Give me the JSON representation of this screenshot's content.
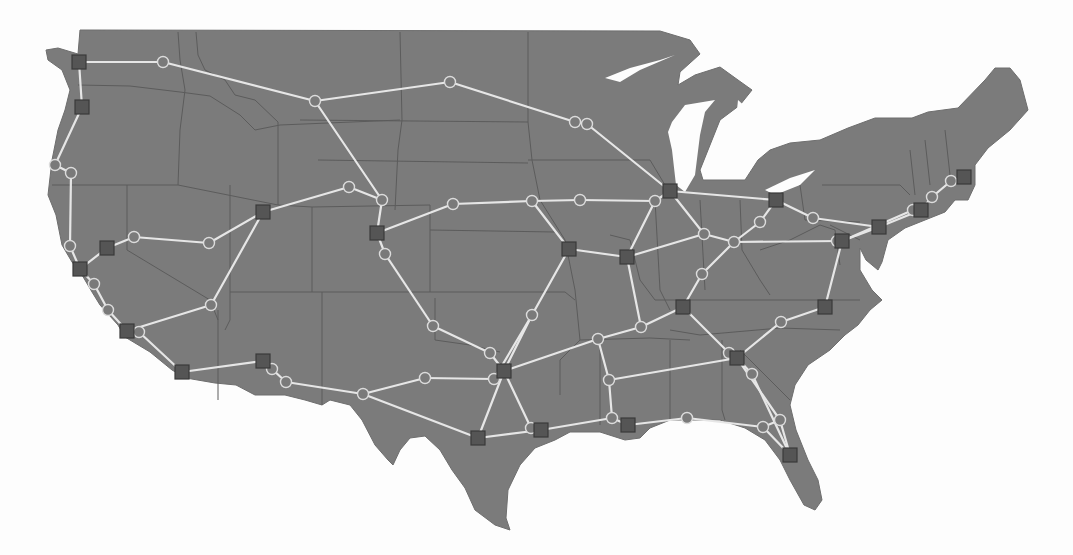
{
  "map": {
    "region": "Contiguous United States",
    "colors": {
      "background": "#fdfdfd",
      "land": "#7b7b7b",
      "state_border": "#5c5c5c",
      "link": "#e6e6e6",
      "hub_fill": "#555555",
      "relay_fill": "#7a7a7a",
      "relay_stroke": "#dcdcdc"
    },
    "legend_icons": {
      "hub": "square-node-icon",
      "relay": "circle-node-icon"
    },
    "hubs": [
      {
        "id": "h1",
        "x": 79,
        "y": 62
      },
      {
        "id": "h2",
        "x": 82,
        "y": 107
      },
      {
        "id": "h3",
        "x": 107,
        "y": 248
      },
      {
        "id": "h4",
        "x": 80,
        "y": 269
      },
      {
        "id": "h5",
        "x": 127,
        "y": 331
      },
      {
        "id": "h6",
        "x": 182,
        "y": 372
      },
      {
        "id": "h7",
        "x": 263,
        "y": 361
      },
      {
        "id": "h8",
        "x": 263,
        "y": 212
      },
      {
        "id": "h9",
        "x": 377,
        "y": 233
      },
      {
        "id": "h10",
        "x": 569,
        "y": 249
      },
      {
        "id": "h11",
        "x": 627,
        "y": 257
      },
      {
        "id": "h12",
        "x": 670,
        "y": 191
      },
      {
        "id": "h13",
        "x": 776,
        "y": 200
      },
      {
        "id": "h14",
        "x": 683,
        "y": 307
      },
      {
        "id": "h15",
        "x": 737,
        "y": 358
      },
      {
        "id": "h16",
        "x": 825,
        "y": 307
      },
      {
        "id": "h17",
        "x": 842,
        "y": 241
      },
      {
        "id": "h18",
        "x": 879,
        "y": 227
      },
      {
        "id": "h19",
        "x": 921,
        "y": 210
      },
      {
        "id": "h20",
        "x": 964,
        "y": 177
      },
      {
        "id": "h21",
        "x": 504,
        "y": 371
      },
      {
        "id": "h22",
        "x": 478,
        "y": 438
      },
      {
        "id": "h23",
        "x": 541,
        "y": 430
      },
      {
        "id": "h24",
        "x": 628,
        "y": 425
      },
      {
        "id": "h25",
        "x": 790,
        "y": 455
      }
    ],
    "relays": [
      {
        "id": "r1",
        "x": 163,
        "y": 62
      },
      {
        "id": "r2",
        "x": 315,
        "y": 101
      },
      {
        "id": "r3",
        "x": 450,
        "y": 82
      },
      {
        "id": "r4",
        "x": 575,
        "y": 122
      },
      {
        "id": "r5",
        "x": 587,
        "y": 124
      },
      {
        "id": "r6",
        "x": 55,
        "y": 165
      },
      {
        "id": "r7",
        "x": 71,
        "y": 173
      },
      {
        "id": "r8",
        "x": 70,
        "y": 246
      },
      {
        "id": "r9",
        "x": 134,
        "y": 237
      },
      {
        "id": "r10",
        "x": 209,
        "y": 243
      },
      {
        "id": "r11",
        "x": 349,
        "y": 187
      },
      {
        "id": "r12",
        "x": 382,
        "y": 200
      },
      {
        "id": "r13",
        "x": 453,
        "y": 204
      },
      {
        "id": "r14",
        "x": 532,
        "y": 201
      },
      {
        "id": "r15",
        "x": 580,
        "y": 200
      },
      {
        "id": "r16",
        "x": 655,
        "y": 201
      },
      {
        "id": "r17",
        "x": 385,
        "y": 254
      },
      {
        "id": "r18",
        "x": 211,
        "y": 305
      },
      {
        "id": "r19",
        "x": 94,
        "y": 284
      },
      {
        "id": "r20",
        "x": 108,
        "y": 310
      },
      {
        "id": "r21",
        "x": 139,
        "y": 332
      },
      {
        "id": "r22",
        "x": 272,
        "y": 369
      },
      {
        "id": "r23",
        "x": 286,
        "y": 382
      },
      {
        "id": "r24",
        "x": 363,
        "y": 394
      },
      {
        "id": "r25",
        "x": 425,
        "y": 378
      },
      {
        "id": "r26",
        "x": 433,
        "y": 326
      },
      {
        "id": "r27",
        "x": 490,
        "y": 353
      },
      {
        "id": "r28",
        "x": 532,
        "y": 315
      },
      {
        "id": "r29",
        "x": 494,
        "y": 379
      },
      {
        "id": "r30",
        "x": 531,
        "y": 428
      },
      {
        "id": "r31",
        "x": 598,
        "y": 339
      },
      {
        "id": "r32",
        "x": 609,
        "y": 380
      },
      {
        "id": "r33",
        "x": 612,
        "y": 418
      },
      {
        "id": "r34",
        "x": 641,
        "y": 327
      },
      {
        "id": "r35",
        "x": 704,
        "y": 234
      },
      {
        "id": "r36",
        "x": 734,
        "y": 242
      },
      {
        "id": "r37",
        "x": 760,
        "y": 222
      },
      {
        "id": "r38",
        "x": 813,
        "y": 218
      },
      {
        "id": "r39",
        "x": 702,
        "y": 274
      },
      {
        "id": "r40",
        "x": 729,
        "y": 353
      },
      {
        "id": "r41",
        "x": 752,
        "y": 374
      },
      {
        "id": "r42",
        "x": 781,
        "y": 322
      },
      {
        "id": "r43",
        "x": 687,
        "y": 418
      },
      {
        "id": "r44",
        "x": 763,
        "y": 427
      },
      {
        "id": "r45",
        "x": 780,
        "y": 420
      },
      {
        "id": "r46",
        "x": 837,
        "y": 241
      },
      {
        "id": "r47",
        "x": 913,
        "y": 210
      },
      {
        "id": "r48",
        "x": 932,
        "y": 197
      },
      {
        "id": "r49",
        "x": 951,
        "y": 181
      }
    ],
    "links": [
      [
        "h1",
        "h2"
      ],
      [
        "h1",
        "r1"
      ],
      [
        "r1",
        "r2"
      ],
      [
        "r2",
        "r3"
      ],
      [
        "r3",
        "r4"
      ],
      [
        "r4",
        "r5"
      ],
      [
        "r5",
        "h12"
      ],
      [
        "r2",
        "r12"
      ],
      [
        "h2",
        "r6"
      ],
      [
        "r6",
        "r7"
      ],
      [
        "r7",
        "r8"
      ],
      [
        "r8",
        "h4"
      ],
      [
        "h4",
        "h3"
      ],
      [
        "h3",
        "r9"
      ],
      [
        "r9",
        "r10"
      ],
      [
        "r10",
        "h8"
      ],
      [
        "h8",
        "r11"
      ],
      [
        "r11",
        "r12"
      ],
      [
        "r12",
        "h9"
      ],
      [
        "h9",
        "r17"
      ],
      [
        "h8",
        "r18"
      ],
      [
        "r18",
        "h5"
      ],
      [
        "h4",
        "r19"
      ],
      [
        "r19",
        "r20"
      ],
      [
        "r20",
        "h5"
      ],
      [
        "h5",
        "r21"
      ],
      [
        "r21",
        "h6"
      ],
      [
        "h6",
        "h7"
      ],
      [
        "h7",
        "r22"
      ],
      [
        "r22",
        "r23"
      ],
      [
        "r23",
        "r24"
      ],
      [
        "r24",
        "r25"
      ],
      [
        "r25",
        "r29"
      ],
      [
        "r17",
        "r26"
      ],
      [
        "r26",
        "r27"
      ],
      [
        "r27",
        "h21"
      ],
      [
        "h9",
        "r13"
      ],
      [
        "r13",
        "r14"
      ],
      [
        "r14",
        "r15"
      ],
      [
        "r15",
        "r16"
      ],
      [
        "r16",
        "h12"
      ],
      [
        "r14",
        "h10"
      ],
      [
        "h10",
        "h11"
      ],
      [
        "h10",
        "r28"
      ],
      [
        "r28",
        "h21"
      ],
      [
        "r28",
        "r29"
      ],
      [
        "r29",
        "h21"
      ],
      [
        "h21",
        "h22"
      ],
      [
        "r24",
        "h22"
      ],
      [
        "h21",
        "r30"
      ],
      [
        "r30",
        "h23"
      ],
      [
        "h22",
        "h23"
      ],
      [
        "h21",
        "r31"
      ],
      [
        "r31",
        "r32"
      ],
      [
        "r32",
        "r33"
      ],
      [
        "r33",
        "h24"
      ],
      [
        "h23",
        "r33"
      ],
      [
        "h24",
        "r43"
      ],
      [
        "r43",
        "r44"
      ],
      [
        "r44",
        "h25"
      ],
      [
        "r44",
        "r45"
      ],
      [
        "r45",
        "h25"
      ],
      [
        "h15",
        "r45"
      ],
      [
        "h15",
        "r41"
      ],
      [
        "r41",
        "h25"
      ],
      [
        "r32",
        "h15"
      ],
      [
        "h15",
        "r40"
      ],
      [
        "r40",
        "h14"
      ],
      [
        "h14",
        "r34"
      ],
      [
        "r34",
        "h11"
      ],
      [
        "r34",
        "r31"
      ],
      [
        "h11",
        "r16"
      ],
      [
        "h11",
        "r35"
      ],
      [
        "h12",
        "r35"
      ],
      [
        "r35",
        "r36"
      ],
      [
        "r36",
        "r37"
      ],
      [
        "r37",
        "h13"
      ],
      [
        "h12",
        "h13"
      ],
      [
        "h13",
        "r38"
      ],
      [
        "r38",
        "h18"
      ],
      [
        "r36",
        "h17"
      ],
      [
        "r36",
        "r39"
      ],
      [
        "r39",
        "h14"
      ],
      [
        "h17",
        "h16"
      ],
      [
        "h16",
        "r42"
      ],
      [
        "r42",
        "h15"
      ],
      [
        "h17",
        "h18"
      ],
      [
        "h18",
        "h19"
      ],
      [
        "h17",
        "r47"
      ],
      [
        "r47",
        "h19"
      ],
      [
        "h19",
        "r48"
      ],
      [
        "r48",
        "r49"
      ],
      [
        "r49",
        "h20"
      ]
    ]
  }
}
